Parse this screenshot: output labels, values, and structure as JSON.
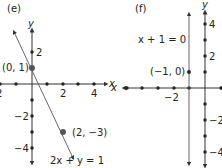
{
  "panels": [
    {
      "id": "e",
      "label": "(e)",
      "x_axis_label": "x",
      "y_axis_label": "y",
      "x_ticks": [
        {
          "value": -2,
          "label": "2"
        },
        {
          "value": 2,
          "label": "2"
        },
        {
          "value": 4,
          "label": "4"
        }
      ],
      "y_ticks": [
        {
          "value": 2,
          "label": "2"
        },
        {
          "value": -2,
          "label": "−2"
        },
        {
          "value": -4,
          "label": "−4"
        }
      ],
      "points": [
        {
          "label": "(0, 1)",
          "x": 0,
          "y": 1
        },
        {
          "label": "(2, −3)",
          "x": 2,
          "y": -3
        }
      ],
      "line_equation": "2x + y = 1"
    },
    {
      "id": "f",
      "label": "(f)",
      "x_axis_label": "x",
      "y_axis_label": "y",
      "x_ticks": [
        {
          "value": -2,
          "label": "−2"
        }
      ],
      "y_ticks": [
        {
          "value": 4,
          "label": "4"
        },
        {
          "value": 2,
          "label": "2"
        },
        {
          "value": -2,
          "label": "−2"
        },
        {
          "value": -4,
          "label": "−4"
        }
      ],
      "points": [
        {
          "label": "(−1, 0)",
          "x": -1,
          "y": 0
        }
      ],
      "line_equation": "x + 1 = 0"
    }
  ]
}
